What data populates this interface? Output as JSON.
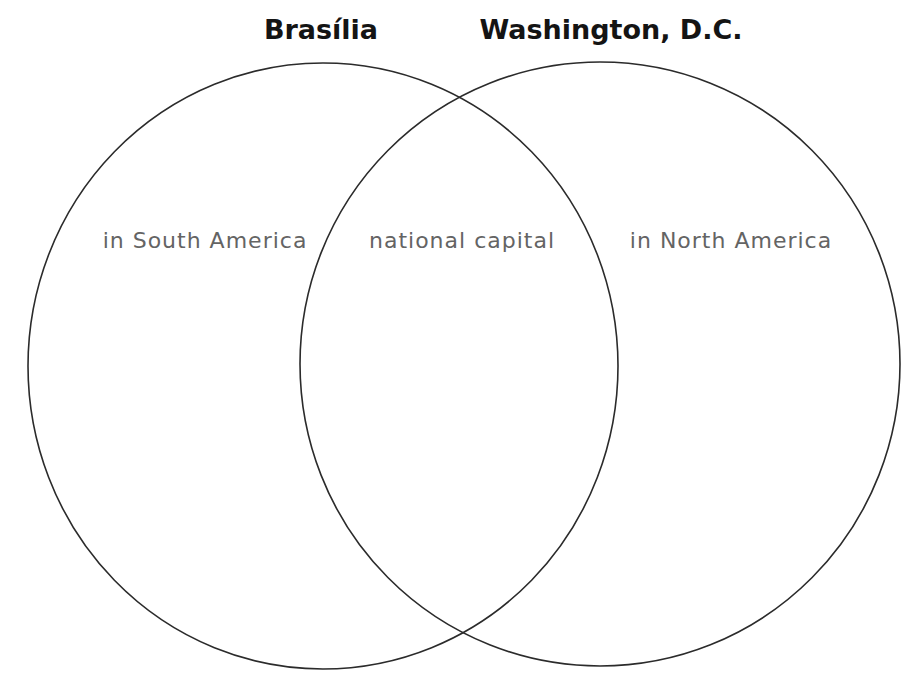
{
  "diagram": {
    "type": "venn-diagram",
    "background_color": "#ffffff",
    "circle_stroke_color": "#2b2b2b",
    "title_color": "#141414",
    "label_color": "#646464",
    "left_circle": {
      "title": "Brasília",
      "label": "in South America"
    },
    "right_circle": {
      "title": "Washington, D.C.",
      "label": "in North America"
    },
    "intersection": {
      "label": "national capital"
    }
  }
}
